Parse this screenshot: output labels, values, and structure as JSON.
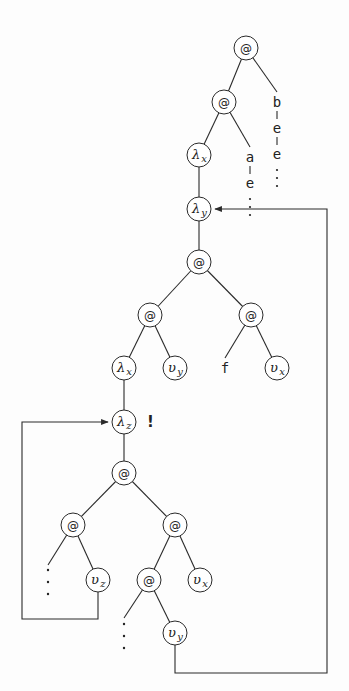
{
  "diagram": {
    "type": "graph-reduction-tree",
    "node_radius": 12,
    "colors": {
      "ink": "#2a2a2a",
      "background": "#fdfdfd"
    },
    "nodes": [
      {
        "id": "app1",
        "kind": "app",
        "label": "@",
        "x": 246,
        "y": 48
      },
      {
        "id": "app2",
        "kind": "app",
        "label": "@",
        "x": 224,
        "y": 102
      },
      {
        "id": "lamx1",
        "kind": "lambda",
        "label": "λ",
        "sub": "x",
        "x": 199,
        "y": 155
      },
      {
        "id": "lamy",
        "kind": "lambda",
        "label": "λ",
        "sub": "y",
        "x": 199,
        "y": 209
      },
      {
        "id": "app3",
        "kind": "app",
        "label": "@",
        "x": 199,
        "y": 262
      },
      {
        "id": "app4",
        "kind": "app",
        "label": "@",
        "x": 150,
        "y": 315
      },
      {
        "id": "app5",
        "kind": "app",
        "label": "@",
        "x": 251,
        "y": 315
      },
      {
        "id": "lamx2",
        "kind": "lambda",
        "label": "λ",
        "sub": "x",
        "x": 124,
        "y": 368
      },
      {
        "id": "vy1",
        "kind": "var",
        "label": "υ",
        "sub": "y",
        "x": 175,
        "y": 368
      },
      {
        "id": "vx1",
        "kind": "var",
        "label": "υ",
        "sub": "x",
        "x": 277,
        "y": 368
      },
      {
        "id": "lamz",
        "kind": "lambda",
        "label": "λ",
        "sub": "z",
        "x": 124,
        "y": 422
      },
      {
        "id": "app6",
        "kind": "app",
        "label": "@",
        "x": 124,
        "y": 473
      },
      {
        "id": "app7",
        "kind": "app",
        "label": "@",
        "x": 73,
        "y": 525
      },
      {
        "id": "app8",
        "kind": "app",
        "label": "@",
        "x": 175,
        "y": 525
      },
      {
        "id": "vz",
        "kind": "var",
        "label": "υ",
        "sub": "z",
        "x": 98,
        "y": 580
      },
      {
        "id": "app9",
        "kind": "app",
        "label": "@",
        "x": 149,
        "y": 580
      },
      {
        "id": "vx2",
        "kind": "var",
        "label": "υ",
        "sub": "x",
        "x": 200,
        "y": 580
      },
      {
        "id": "vy2",
        "kind": "var",
        "label": "υ",
        "sub": "y",
        "x": 175,
        "y": 633
      }
    ],
    "constants": [
      {
        "id": "f",
        "label": "f",
        "x": 225,
        "y": 368
      },
      {
        "id": "a",
        "label": "a",
        "x": 250,
        "y": 157
      },
      {
        "id": "b",
        "label": "b",
        "x": 277,
        "y": 102
      }
    ],
    "chains": [
      {
        "id": "chain-a",
        "x": 250,
        "items": [
          "a",
          "e"
        ],
        "start_y": 157
      },
      {
        "id": "chain-b",
        "x": 277,
        "items": [
          "b",
          "e",
          "e"
        ],
        "start_y": 102
      }
    ],
    "annotations": [
      {
        "id": "bang",
        "text": "!",
        "x": 147,
        "y": 427
      }
    ],
    "back_edges": [
      {
        "id": "loop-z",
        "from": "vz",
        "to": "lamz",
        "path": "M98 592 L98 619 L22 619 L22 422 L108 422"
      },
      {
        "id": "loop-y",
        "from": "vy2",
        "to": "lamy",
        "path": "M175 645 L175 673 L327 673 L327 209 L215 209"
      }
    ]
  }
}
